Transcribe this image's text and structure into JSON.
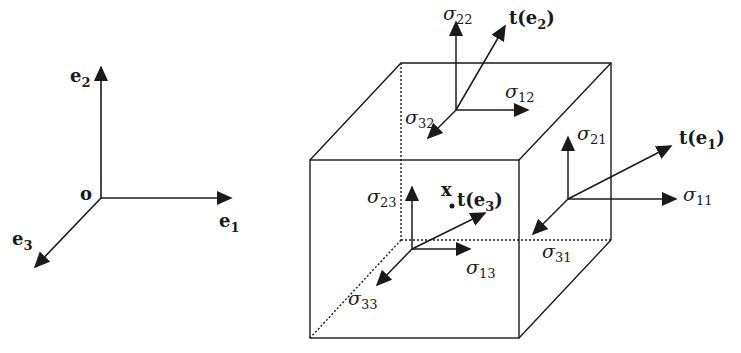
{
  "diagram": {
    "colors": {
      "stroke": "#1a1a1a",
      "background": "#ffffff"
    },
    "basis_frame": {
      "origin_label": "o",
      "axes": [
        {
          "id": "e1",
          "label": "e",
          "subscript": "1",
          "direction": "right"
        },
        {
          "id": "e2",
          "label": "e",
          "subscript": "2",
          "direction": "up"
        },
        {
          "id": "e3",
          "label": "e",
          "subscript": "3",
          "direction": "down-left"
        }
      ]
    },
    "cube": {
      "point_label": "x",
      "faces": [
        {
          "id": "top",
          "traction": {
            "prefix": "t(",
            "vec": "e",
            "subscript": "2",
            "suffix": ")"
          },
          "components": [
            {
              "symbol": "σ",
              "subscript": "22",
              "direction": "up"
            },
            {
              "symbol": "σ",
              "subscript": "12",
              "direction": "right"
            },
            {
              "symbol": "σ",
              "subscript": "32",
              "direction": "down-left"
            }
          ]
        },
        {
          "id": "right",
          "traction": {
            "prefix": "t(",
            "vec": "e",
            "subscript": "1",
            "suffix": ")"
          },
          "components": [
            {
              "symbol": "σ",
              "subscript": "21",
              "direction": "up"
            },
            {
              "symbol": "σ",
              "subscript": "11",
              "direction": "right"
            },
            {
              "symbol": "σ",
              "subscript": "31",
              "direction": "down-left"
            }
          ]
        },
        {
          "id": "front",
          "traction": {
            "prefix": "t(",
            "vec": "e",
            "subscript": "3",
            "suffix": ")"
          },
          "components": [
            {
              "symbol": "σ",
              "subscript": "23",
              "direction": "up"
            },
            {
              "symbol": "σ",
              "subscript": "13",
              "direction": "right"
            },
            {
              "symbol": "σ",
              "subscript": "33",
              "direction": "down-left"
            }
          ]
        }
      ]
    }
  }
}
